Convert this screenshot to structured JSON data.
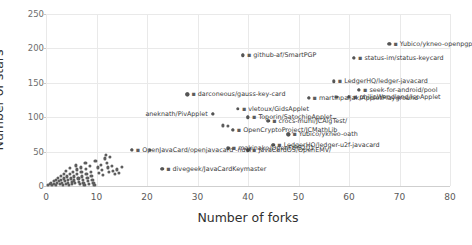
{
  "chart_data": {
    "type": "scatter",
    "title": "",
    "xlabel": "Number of forks",
    "ylabel": "Number of stars",
    "xlim": [
      0,
      80
    ],
    "ylim": [
      0,
      250
    ],
    "xticks": [
      0,
      10,
      20,
      30,
      40,
      50,
      60,
      70,
      80
    ],
    "yticks": [
      0,
      50,
      100,
      150,
      200,
      250
    ],
    "grid": true,
    "legend": "none",
    "marker_color": "#5d5d5d",
    "gridline_color": "#e9e9e9",
    "labeled_points": [
      {
        "label": "Yubico/ykneo-openpgp",
        "x": 68,
        "y": 207,
        "anchor": "right"
      },
      {
        "label": "status-im/status-keycard",
        "x": 61,
        "y": 186,
        "anchor": "right"
      },
      {
        "label": "github-af/SmartPGP",
        "x": 39,
        "y": 190,
        "anchor": "right"
      },
      {
        "label": "LedgerHQ/ledger-javacard",
        "x": 57,
        "y": 152,
        "anchor": "right"
      },
      {
        "label": "seek-for-android/pool",
        "x": 62,
        "y": 140,
        "anchor": "right"
      },
      {
        "label": "philipWendland/IsoApplet",
        "x": 60,
        "y": 130,
        "anchor": "right"
      },
      {
        "label": "martinpaljak/AppletPlayground",
        "x": 52,
        "y": 128,
        "anchor": "right"
      },
      {
        "label": "darconeous/gauss-key-card",
        "x": 28,
        "y": 133,
        "anchor": "right"
      },
      {
        "label": "vletoux/GidsApplet",
        "x": 38,
        "y": 112,
        "anchor": "right"
      },
      {
        "label": "aneknath/PivApplet",
        "x": 33,
        "y": 105,
        "anchor": "left"
      },
      {
        "label": "Toporin/SatochipApplet",
        "x": 40,
        "y": 100,
        "anchor": "right"
      },
      {
        "label": "crocs-muni/JCAlgTest/",
        "x": 44,
        "y": 95,
        "anchor": "right"
      },
      {
        "label": "OpenCryptoProject/JCMathLib",
        "x": 37,
        "y": 82,
        "anchor": "right"
      },
      {
        "label": "Yubico/ykneo-oath",
        "x": 48,
        "y": 75,
        "anchor": "right"
      },
      {
        "label": "LedgerHQ/ledger-u2f-javacard",
        "x": 45,
        "y": 60,
        "anchor": "right"
      },
      {
        "label": "makinako/OpenFIPS201",
        "x": 36,
        "y": 55,
        "anchor": "right"
      },
      {
        "label": "JavaCardOS/OpenEMV/",
        "x": 40,
        "y": 52,
        "anchor": "right"
      },
      {
        "label": "OpenJavaCard/openjavacard -ndef",
        "x": 17,
        "y": 53,
        "anchor": "right"
      },
      {
        "label": "divegeek/JavaCardKeymaster",
        "x": 23,
        "y": 25,
        "anchor": "right"
      }
    ],
    "unlabeled_points": [
      {
        "x": 0.4,
        "y": 2
      },
      {
        "x": 0.8,
        "y": 3
      },
      {
        "x": 1.0,
        "y": 5
      },
      {
        "x": 1.2,
        "y": 1
      },
      {
        "x": 1.5,
        "y": 7
      },
      {
        "x": 1.6,
        "y": 3
      },
      {
        "x": 1.9,
        "y": 9
      },
      {
        "x": 2.0,
        "y": 2
      },
      {
        "x": 2.2,
        "y": 5
      },
      {
        "x": 2.4,
        "y": 12
      },
      {
        "x": 2.5,
        "y": 7
      },
      {
        "x": 2.7,
        "y": 3
      },
      {
        "x": 2.9,
        "y": 15
      },
      {
        "x": 3.0,
        "y": 9
      },
      {
        "x": 3.1,
        "y": 5
      },
      {
        "x": 3.3,
        "y": 2
      },
      {
        "x": 3.5,
        "y": 18
      },
      {
        "x": 3.6,
        "y": 11
      },
      {
        "x": 3.8,
        "y": 7
      },
      {
        "x": 3.9,
        "y": 3
      },
      {
        "x": 4.0,
        "y": 22
      },
      {
        "x": 4.1,
        "y": 14
      },
      {
        "x": 4.3,
        "y": 9
      },
      {
        "x": 4.4,
        "y": 5
      },
      {
        "x": 4.5,
        "y": 2
      },
      {
        "x": 4.7,
        "y": 26
      },
      {
        "x": 4.8,
        "y": 17
      },
      {
        "x": 5.0,
        "y": 11
      },
      {
        "x": 5.1,
        "y": 6
      },
      {
        "x": 5.2,
        "y": 3
      },
      {
        "x": 5.4,
        "y": 21
      },
      {
        "x": 5.5,
        "y": 14
      },
      {
        "x": 5.6,
        "y": 8
      },
      {
        "x": 5.8,
        "y": 4
      },
      {
        "x": 6.0,
        "y": 30
      },
      {
        "x": 6.1,
        "y": 24
      },
      {
        "x": 6.2,
        "y": 17
      },
      {
        "x": 6.4,
        "y": 11
      },
      {
        "x": 6.5,
        "y": 6
      },
      {
        "x": 6.7,
        "y": 3
      },
      {
        "x": 6.9,
        "y": 27
      },
      {
        "x": 7.0,
        "y": 20
      },
      {
        "x": 7.1,
        "y": 14
      },
      {
        "x": 7.3,
        "y": 9
      },
      {
        "x": 7.4,
        "y": 5
      },
      {
        "x": 7.6,
        "y": 2
      },
      {
        "x": 7.8,
        "y": 33
      },
      {
        "x": 7.9,
        "y": 25
      },
      {
        "x": 8.0,
        "y": 18
      },
      {
        "x": 8.2,
        "y": 12
      },
      {
        "x": 8.3,
        "y": 7
      },
      {
        "x": 8.5,
        "y": 3
      },
      {
        "x": 8.7,
        "y": 29
      },
      {
        "x": 8.9,
        "y": 21
      },
      {
        "x": 9.0,
        "y": 15
      },
      {
        "x": 9.2,
        "y": 9
      },
      {
        "x": 9.4,
        "y": 5
      },
      {
        "x": 9.6,
        "y": 2
      },
      {
        "x": 9.8,
        "y": 36
      },
      {
        "x": 10.2,
        "y": 27
      },
      {
        "x": 10.5,
        "y": 19
      },
      {
        "x": 10.8,
        "y": 31
      },
      {
        "x": 11.0,
        "y": 23
      },
      {
        "x": 11.3,
        "y": 16
      },
      {
        "x": 11.6,
        "y": 40
      },
      {
        "x": 11.9,
        "y": 45
      },
      {
        "x": 12.0,
        "y": 34
      },
      {
        "x": 12.2,
        "y": 27
      },
      {
        "x": 12.4,
        "y": 20
      },
      {
        "x": 12.7,
        "y": 42
      },
      {
        "x": 13.0,
        "y": 29
      },
      {
        "x": 13.3,
        "y": 22
      },
      {
        "x": 13.6,
        "y": 18
      },
      {
        "x": 14.0,
        "y": 24
      },
      {
        "x": 14.4,
        "y": 19
      },
      {
        "x": 15.0,
        "y": 28
      },
      {
        "x": 17.0,
        "y": 53
      },
      {
        "x": 20.5,
        "y": 53
      },
      {
        "x": 23.0,
        "y": 25
      },
      {
        "x": 33.0,
        "y": 105
      },
      {
        "x": 35.0,
        "y": 88
      },
      {
        "x": 36.0,
        "y": 87
      },
      {
        "x": 36.2,
        "y": 55
      },
      {
        "x": 37.0,
        "y": 82
      },
      {
        "x": 39.0,
        "y": 190
      },
      {
        "x": 40.0,
        "y": 100
      },
      {
        "x": 40.2,
        "y": 52
      },
      {
        "x": 44.0,
        "y": 95
      },
      {
        "x": 45.0,
        "y": 60
      },
      {
        "x": 48.0,
        "y": 75
      },
      {
        "x": 52.0,
        "y": 128
      },
      {
        "x": 57.5,
        "y": 130
      },
      {
        "x": 60.0,
        "y": 130
      },
      {
        "x": 61.0,
        "y": 186
      },
      {
        "x": 62.0,
        "y": 140
      },
      {
        "x": 68.0,
        "y": 207
      },
      {
        "x": 28.0,
        "y": 133
      }
    ]
  }
}
